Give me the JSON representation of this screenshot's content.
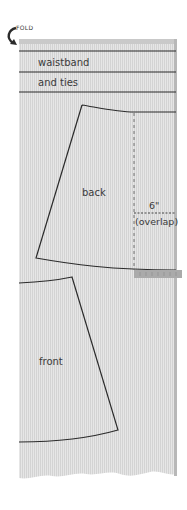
{
  "diagram": {
    "fold_label": "FOLD",
    "sections": {
      "waistband_line1": "waistband",
      "waistband_line2": "and ties"
    },
    "pieces": {
      "back_label": "back",
      "front_label": "front"
    },
    "overlap": {
      "measure": "6\"",
      "note": "(overlap)"
    },
    "colors": {
      "fabric": "#e3e3e3",
      "stripe": "#d2d2d2",
      "selvage": "#b8b8b8",
      "outline": "#2b2b2b",
      "ruler": "#a9a9a9"
    }
  }
}
